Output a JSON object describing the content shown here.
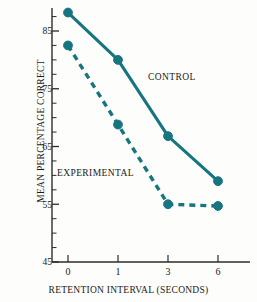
{
  "chart_data": {
    "type": "line",
    "title": "",
    "xlabel": "RETENTION INTERVAL (SECONDS)",
    "ylabel": "MEAN PERCENTAGE CORRECT",
    "categories": [
      "0",
      "1",
      "3",
      "6"
    ],
    "ylim": [
      45,
      89
    ],
    "ytick_labels": [
      "85",
      "75",
      "65",
      "55",
      "45"
    ],
    "ytick_values": [
      85,
      75,
      65,
      55,
      45
    ],
    "yminor_step": 2.5,
    "grid": false,
    "legend_position": "inline-annotation",
    "accent_color": "#17757f",
    "axis_color": "#2b2b2b",
    "series": [
      {
        "name": "CONTROL",
        "label": "CONTROL",
        "linestyle": "solid",
        "marker": "circle",
        "values": [
          88.2,
          80.0,
          66.8,
          59.0
        ]
      },
      {
        "name": "EXPERIMENTAL",
        "label": "EXPERIMENTAL",
        "linestyle": "dashed",
        "marker": "circle",
        "values": [
          82.5,
          68.8,
          55.0,
          54.7
        ]
      }
    ]
  },
  "axes": {
    "y_axis_label": "MEAN PERCENTAGE CORRECT",
    "x_axis_label": "RETENTION INTERVAL (SECONDS)"
  }
}
